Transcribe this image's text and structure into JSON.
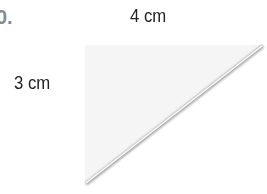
{
  "problem": {
    "number": "0."
  },
  "figure": {
    "shape": "right-triangle",
    "top_side_label": "4 cm",
    "left_side_label": "3 cm",
    "fill_color": "#f4f4f4",
    "edge_color": "#9a9a9a"
  }
}
